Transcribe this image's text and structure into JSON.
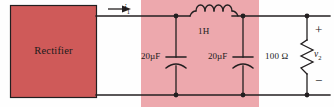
{
  "figure": {
    "type": "circuit-schematic"
  },
  "blocks": {
    "rectifier": {
      "label": "Rectifier",
      "fill": "#cf5a59",
      "stroke": "#231f20"
    },
    "filter_region": {
      "fill": "#eda8ad"
    }
  },
  "components": {
    "current": {
      "label": "i",
      "subscript": "1"
    },
    "inductor": {
      "value": "1H",
      "name": "inductor-1h"
    },
    "capacitor1": {
      "value": "20µF",
      "name": "capacitor-20uf-left"
    },
    "capacitor2": {
      "value": "20µF",
      "name": "capacitor-20uf-right"
    },
    "resistor": {
      "value": "100 Ω",
      "name": "resistor-100-ohm"
    },
    "output": {
      "label": "v",
      "subscript": "2",
      "plus": "+",
      "minus": "−"
    }
  },
  "colors": {
    "wire": "#231f20",
    "background": "#fefefe",
    "rectifier_fill": "#cf5a59",
    "filter_fill": "#eda8ad"
  }
}
